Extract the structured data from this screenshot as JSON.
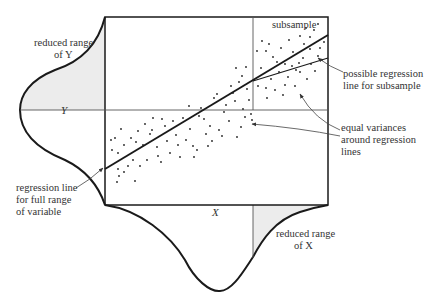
{
  "diagram": {
    "colors": {
      "ink": "#1a1a1a",
      "thin": "#555555",
      "shade": "#ececec",
      "text": "#333333"
    },
    "labels": {
      "reduced_range_y_1": "reduced range",
      "reduced_range_y_2": "of Y",
      "axis_y": "Y",
      "axis_x": "X",
      "subsample": "subsample",
      "possible_regression_1": "possible regression",
      "possible_regression_2": "line for subsample",
      "equal_variances_1": "equal variances",
      "equal_variances_2": "around regression",
      "equal_variances_3": "lines",
      "regression_full_1": "regression line",
      "regression_full_2": "for full range",
      "regression_full_3": "of variable",
      "reduced_range_x_1": "reduced range",
      "reduced_range_x_2": "of X"
    },
    "box": {
      "x1": 105,
      "y1": 17,
      "x2": 328,
      "y2": 205
    },
    "y_mean_line_y": 110,
    "subsample_divider_x": 253,
    "regression_full": {
      "x1": 105,
      "y1": 169,
      "x2": 328,
      "y2": 35
    },
    "regression_subsample": {
      "x1": 253,
      "y1": 81,
      "x2": 328,
      "y2": 58
    },
    "scatter_points": [
      [
        111,
        140
      ],
      [
        115,
        138
      ],
      [
        118,
        153
      ],
      [
        112,
        150
      ],
      [
        121,
        129
      ],
      [
        124,
        145
      ],
      [
        118,
        169
      ],
      [
        119,
        176
      ],
      [
        117,
        182
      ],
      [
        124,
        172
      ],
      [
        128,
        166
      ],
      [
        133,
        160
      ],
      [
        131,
        138
      ],
      [
        138,
        131
      ],
      [
        136,
        142
      ],
      [
        143,
        145
      ],
      [
        140,
        166
      ],
      [
        135,
        181
      ],
      [
        145,
        124
      ],
      [
        150,
        134
      ],
      [
        147,
        160
      ],
      [
        153,
        118
      ],
      [
        152,
        130
      ],
      [
        157,
        147
      ],
      [
        158,
        156
      ],
      [
        162,
        119
      ],
      [
        165,
        126
      ],
      [
        161,
        162
      ],
      [
        167,
        141
      ],
      [
        170,
        153
      ],
      [
        173,
        121
      ],
      [
        176,
        135
      ],
      [
        178,
        145
      ],
      [
        180,
        157
      ],
      [
        183,
        118
      ],
      [
        186,
        140
      ],
      [
        189,
        106
      ],
      [
        190,
        129
      ],
      [
        193,
        146
      ],
      [
        194,
        157
      ],
      [
        197,
        150
      ],
      [
        199,
        116
      ],
      [
        201,
        108
      ],
      [
        204,
        119
      ],
      [
        206,
        134
      ],
      [
        208,
        146
      ],
      [
        210,
        126
      ],
      [
        212,
        141
      ],
      [
        214,
        98
      ],
      [
        217,
        94
      ],
      [
        219,
        130
      ],
      [
        222,
        136
      ],
      [
        224,
        112
      ],
      [
        226,
        105
      ],
      [
        229,
        121
      ],
      [
        231,
        86
      ],
      [
        233,
        93
      ],
      [
        235,
        101
      ],
      [
        237,
        137
      ],
      [
        239,
        82
      ],
      [
        241,
        127
      ],
      [
        243,
        109
      ],
      [
        245,
        117
      ],
      [
        247,
        89
      ],
      [
        249,
        100
      ],
      [
        251,
        114
      ],
      [
        252,
        120
      ],
      [
        246,
        67
      ],
      [
        242,
        76
      ],
      [
        236,
        68
      ],
      [
        257,
        51
      ],
      [
        262,
        41
      ],
      [
        266,
        51
      ],
      [
        269,
        44
      ],
      [
        273,
        57
      ],
      [
        277,
        62
      ],
      [
        281,
        48
      ],
      [
        285,
        64
      ],
      [
        289,
        40
      ],
      [
        293,
        52
      ],
      [
        296,
        70
      ],
      [
        300,
        36
      ],
      [
        304,
        44
      ],
      [
        306,
        28
      ],
      [
        310,
        37
      ],
      [
        314,
        30
      ],
      [
        318,
        24
      ],
      [
        320,
        48
      ],
      [
        324,
        42
      ],
      [
        261,
        68
      ],
      [
        266,
        88
      ],
      [
        271,
        79
      ],
      [
        275,
        90
      ],
      [
        279,
        72
      ],
      [
        283,
        95
      ],
      [
        288,
        77
      ],
      [
        292,
        66
      ],
      [
        295,
        86
      ],
      [
        300,
        72
      ],
      [
        303,
        58
      ],
      [
        307,
        79
      ],
      [
        311,
        64
      ],
      [
        315,
        71
      ],
      [
        318,
        56
      ],
      [
        322,
        60
      ],
      [
        258,
        86
      ],
      [
        285,
        85
      ],
      [
        267,
        98
      ],
      [
        299,
        63
      ],
      [
        310,
        49
      ]
    ],
    "arrows": [
      {
        "name": "arrow-possible-regression",
        "path": "M343,72 Q330,67 318,58"
      },
      {
        "name": "arrow-equal-variances-upper",
        "path": "M340,130 Q315,120 300,94"
      },
      {
        "name": "arrow-equal-variances-lower",
        "path": "M340,136 Q300,128 252,124"
      },
      {
        "name": "arrow-regression-full",
        "path": "M76,188 Q90,180 103,168"
      }
    ]
  }
}
